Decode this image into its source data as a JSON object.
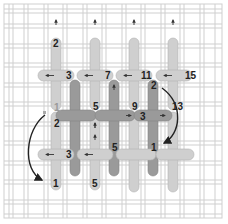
{
  "diagram": {
    "type": "needlework-stitch-diagram",
    "colors": {
      "background": "#ffffff",
      "canvas_thread": "#dcdcdc",
      "canvas_thread_edge": "#c4c4c4",
      "stitch_light": "#cfcfcf",
      "stitch_light_edge": "#b3b3b3",
      "stitch_dark": "#9a9a9a",
      "stitch_dark_edge": "#858585",
      "arrow": "#222222",
      "label": "#222222"
    },
    "labels": {
      "top_row": [
        {
          "id": "t-2",
          "text": "2"
        },
        {
          "id": "t-3",
          "text": "3"
        },
        {
          "id": "t-7",
          "text": "7"
        },
        {
          "id": "t-11",
          "text": "11"
        },
        {
          "id": "t-15",
          "text": "15"
        }
      ],
      "middle_row": [
        {
          "id": "m-1",
          "text": "1"
        },
        {
          "id": "m-2",
          "text": "2"
        },
        {
          "id": "m-5",
          "text": "5"
        },
        {
          "id": "m-9",
          "text": "9"
        },
        {
          "id": "m-3",
          "text": "3"
        },
        {
          "id": "m-2b",
          "text": "2"
        },
        {
          "id": "m-13",
          "text": "13"
        }
      ],
      "bottom_row": [
        {
          "id": "b-3",
          "text": "3"
        },
        {
          "id": "b-5",
          "text": "5"
        },
        {
          "id": "b-1",
          "text": "1"
        },
        {
          "id": "b-1b",
          "text": "1"
        },
        {
          "id": "b-5b",
          "text": "5"
        }
      ]
    },
    "arrows": [
      {
        "id": "curve-left",
        "description": "curved arrow from left middle down to lower-left stitch start"
      },
      {
        "id": "curve-right",
        "description": "curved arrow from top-right 2 down to bottom 1"
      }
    ]
  }
}
